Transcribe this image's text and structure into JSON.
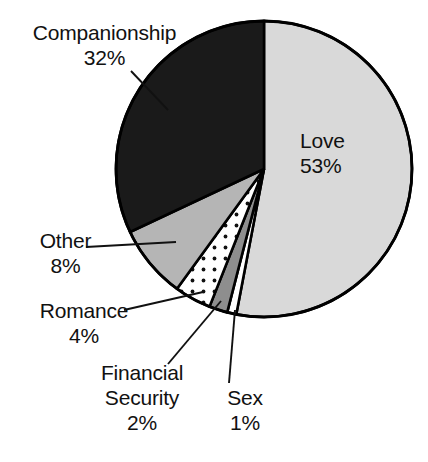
{
  "chart_data": {
    "type": "pie",
    "title": "",
    "subtitle": "",
    "xlabel": "",
    "ylabel": "",
    "legend_position": "none",
    "grid": false,
    "units": "percent",
    "categories": [
      "Love",
      "Companionship",
      "Other",
      "Romance",
      "Financial Security",
      "Sex"
    ],
    "values": [
      53,
      32,
      8,
      4,
      2,
      1
    ],
    "start_angle_deg": 0,
    "direction": "clockwise",
    "slices": [
      {
        "label": "Love",
        "value": 53,
        "value_text": "53%",
        "fill": "#d9d9d9",
        "pattern": "solid",
        "label_placement": "inside",
        "leader_line": false
      },
      {
        "label": "Companionship",
        "value": 32,
        "value_text": "32%",
        "fill": "#1a1a1a",
        "pattern": "solid",
        "label_placement": "outside",
        "leader_line": true
      },
      {
        "label": "Other",
        "value": 8,
        "value_text": "8%",
        "fill": "#b5b5b5",
        "pattern": "solid",
        "label_placement": "outside",
        "leader_line": true
      },
      {
        "label": "Romance",
        "value": 4,
        "value_text": "4%",
        "fill": "#ffffff",
        "pattern": "dotted",
        "label_placement": "outside",
        "leader_line": true
      },
      {
        "label": "Financial Security",
        "value": 2,
        "value_text": "2%",
        "fill": "#8e8e8e",
        "pattern": "solid",
        "label_placement": "outside",
        "leader_line": true
      },
      {
        "label": "Sex",
        "value": 1,
        "value_text": "1%",
        "fill": "#ffffff",
        "pattern": "solid",
        "label_placement": "outside",
        "leader_line": true
      }
    ]
  },
  "labels": {
    "companionship": {
      "name": "Companionship",
      "pct": "32%"
    },
    "love": {
      "name": "Love",
      "pct": "53%"
    },
    "other": {
      "name": "Other",
      "pct": "8%"
    },
    "romance": {
      "name": "Romance",
      "pct": "4%"
    },
    "financial": {
      "name": "Financial",
      "name2": "Security",
      "pct": "2%"
    },
    "sex": {
      "name": "Sex",
      "pct": "1%"
    }
  },
  "colors": {
    "outline": "#000000",
    "love_fill": "#d9d9d9",
    "companionship_fill": "#1a1a1a",
    "other_fill": "#b5b5b5",
    "romance_fill": "#ffffff",
    "financial_fill": "#8e8e8e",
    "sex_fill": "#ffffff",
    "background": "#ffffff",
    "text": "#111111"
  }
}
